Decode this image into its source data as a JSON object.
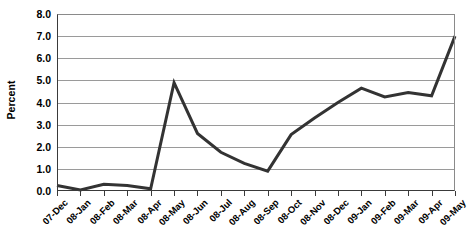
{
  "chart_data": {
    "type": "line",
    "title": "",
    "xlabel": "",
    "ylabel": "Percent",
    "ylim": [
      0.0,
      8.0
    ],
    "ytick_step": 1.0,
    "grid": true,
    "legend": "none",
    "line_color": "#333333",
    "grid_color": "#9a9a9a",
    "axis_color": "#3a3a3a",
    "background": "#ffffff",
    "ytick_labels": [
      "8.0",
      "7.0",
      "6.0",
      "5.0",
      "4.0",
      "3.0",
      "2.0",
      "1.0",
      "0.0"
    ],
    "ytick_values": [
      8.0,
      7.0,
      6.0,
      5.0,
      4.0,
      3.0,
      2.0,
      1.0,
      0.0
    ],
    "categories": [
      "07-Dec",
      "08-Jan",
      "08-Feb",
      "08-Mar",
      "08-Apr",
      "08-May",
      "08-Jun",
      "08-Jul",
      "08-Aug",
      "08-Sep",
      "08-Oct",
      "08-Nov",
      "08-Dec",
      "09-Jan",
      "09-Feb",
      "09-Mar",
      "09-Apr",
      "09-May"
    ],
    "values": [
      0.25,
      0.05,
      0.3,
      0.25,
      0.1,
      4.9,
      2.6,
      1.75,
      1.25,
      0.9,
      2.55,
      3.3,
      4.0,
      4.65,
      4.25,
      4.45,
      4.3,
      7.0
    ]
  }
}
